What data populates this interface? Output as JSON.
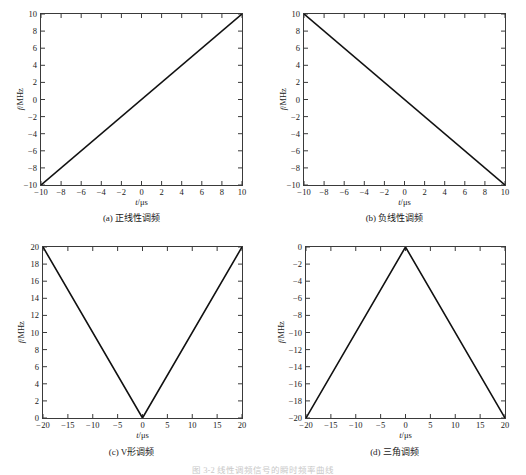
{
  "figure": {
    "background_color": "#ffffff",
    "line_color": "#111111",
    "axis_color": "#3a3a3a",
    "bottom_caption": "图 3-2  线性调频信号的瞬时频率曲线"
  },
  "panels": [
    {
      "key": "a",
      "caption": "(a) 正线性调频",
      "xlabel_var": "t",
      "xlabel_unit": "/μs",
      "ylabel_var": "f",
      "ylabel_unit": "/MHz",
      "xticks": [
        "-10",
        "-8",
        "-6",
        "-4",
        "-2",
        "0",
        "2",
        "4",
        "6",
        "8",
        "10"
      ],
      "yticks": [
        "10",
        "8",
        "6",
        "4",
        "2",
        "0",
        "-2",
        "-4",
        "-6",
        "-8",
        "-10"
      ]
    },
    {
      "key": "b",
      "caption": "(b) 负线性调频",
      "xlabel_var": "t",
      "xlabel_unit": "/μs",
      "ylabel_var": "f",
      "ylabel_unit": "/MHz",
      "xticks": [
        "-10",
        "-8",
        "-6",
        "-4",
        "-2",
        "0",
        "2",
        "4",
        "6",
        "8",
        "10"
      ],
      "yticks": [
        "10",
        "8",
        "6",
        "4",
        "2",
        "0",
        "-2",
        "-4",
        "-6",
        "-8",
        "-10"
      ]
    },
    {
      "key": "c",
      "caption": "(c) V形调频",
      "xlabel_var": "t",
      "xlabel_unit": "/μs",
      "ylabel_var": "f",
      "ylabel_unit": "/MHz",
      "xticks": [
        "-20",
        "-15",
        "-10",
        "-5",
        "0",
        "5",
        "10",
        "15",
        "20"
      ],
      "yticks": [
        "20",
        "18",
        "16",
        "14",
        "12",
        "10",
        "8",
        "6",
        "4",
        "2",
        "0"
      ]
    },
    {
      "key": "d",
      "caption": "(d) 三角调频",
      "xlabel_var": "t",
      "xlabel_unit": "/μs",
      "ylabel_var": "f",
      "ylabel_unit": "/MHz",
      "xticks": [
        "-20",
        "-15",
        "-10",
        "-5",
        "0",
        "5",
        "10",
        "15",
        "20"
      ],
      "yticks": [
        "0",
        "-2",
        "-4",
        "-6",
        "-8",
        "-10",
        "-12",
        "-14",
        "-16",
        "-18",
        "-20"
      ]
    }
  ],
  "chart_data": [
    {
      "type": "line",
      "id": "a",
      "title": "(a) 正线性调频",
      "xlabel": "t/μs",
      "ylabel": "f/MHz",
      "xlim": [
        -10,
        10
      ],
      "ylim": [
        -10,
        10
      ],
      "xticks": [
        -10,
        -8,
        -6,
        -4,
        -2,
        0,
        2,
        4,
        6,
        8,
        10
      ],
      "yticks": [
        -10,
        -8,
        -6,
        -4,
        -2,
        0,
        2,
        4,
        6,
        8,
        10
      ],
      "grid": false,
      "legend": null,
      "series": [
        {
          "name": "up-chirp",
          "x": [
            -10,
            10
          ],
          "values": [
            -10,
            10
          ]
        }
      ]
    },
    {
      "type": "line",
      "id": "b",
      "title": "(b) 负线性调频",
      "xlabel": "t/μs",
      "ylabel": "f/MHz",
      "xlim": [
        -10,
        10
      ],
      "ylim": [
        -10,
        10
      ],
      "xticks": [
        -10,
        -8,
        -6,
        -4,
        -2,
        0,
        2,
        4,
        6,
        8,
        10
      ],
      "yticks": [
        -10,
        -8,
        -6,
        -4,
        -2,
        0,
        2,
        4,
        6,
        8,
        10
      ],
      "grid": false,
      "legend": null,
      "series": [
        {
          "name": "down-chirp",
          "x": [
            -10,
            10
          ],
          "values": [
            10,
            -10
          ]
        }
      ]
    },
    {
      "type": "line",
      "id": "c",
      "title": "(c) V形调频",
      "xlabel": "t/μs",
      "ylabel": "f/MHz",
      "xlim": [
        -20,
        20
      ],
      "ylim": [
        0,
        20
      ],
      "xticks": [
        -20,
        -15,
        -10,
        -5,
        0,
        5,
        10,
        15,
        20
      ],
      "yticks": [
        0,
        2,
        4,
        6,
        8,
        10,
        12,
        14,
        16,
        18,
        20
      ],
      "grid": false,
      "legend": null,
      "series": [
        {
          "name": "v-chirp",
          "x": [
            -20,
            0,
            20
          ],
          "values": [
            20,
            0,
            20
          ]
        }
      ]
    },
    {
      "type": "line",
      "id": "d",
      "title": "(d) 三角调频",
      "xlabel": "t/μs",
      "ylabel": "f/MHz",
      "xlim": [
        -20,
        20
      ],
      "ylim": [
        -20,
        0
      ],
      "xticks": [
        -20,
        -15,
        -10,
        -5,
        0,
        5,
        10,
        15,
        20
      ],
      "yticks": [
        -20,
        -18,
        -16,
        -14,
        -12,
        -10,
        -8,
        -6,
        -4,
        -2,
        0
      ],
      "grid": false,
      "legend": null,
      "series": [
        {
          "name": "triangle-chirp",
          "x": [
            -20,
            0,
            20
          ],
          "values": [
            -20,
            0,
            -20
          ]
        }
      ]
    }
  ]
}
